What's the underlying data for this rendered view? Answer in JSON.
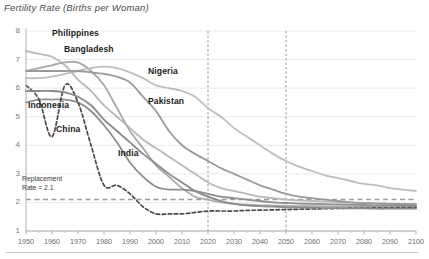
{
  "title": "Fertility Rate (Births per Woman)",
  "annotation": {
    "line1": "Replacement",
    "line2": "Rate = 2.1"
  },
  "axes": {
    "y_ticks": [
      "8",
      "7",
      "6",
      "5",
      "4",
      "3",
      "2",
      "1"
    ],
    "x_ticks": [
      "1950",
      "1960",
      "1970",
      "1980",
      "1990",
      "2000",
      "2010",
      "2020",
      "2030",
      "2040",
      "2050",
      "2060",
      "2070",
      "2080",
      "2090",
      "2100"
    ]
  },
  "series_labels": {
    "philippines": "Philippines",
    "bangladesh": "Bangladesh",
    "nigeria": "Nigeria",
    "pakistan": "Pakistan",
    "indonesia": "Indonesia",
    "china": "China",
    "india": "India"
  },
  "colors": {
    "philippines": "#b9b9b9",
    "bangladesh": "#a8a8a8",
    "nigeria": "#bdbdbd",
    "pakistan": "#9a9a9a",
    "indonesia": "#8e8e8e",
    "china": "#4a4a4a",
    "india": "#8a8a8a",
    "replacement": "#9a9a9a",
    "grid": "#e6e6e6",
    "marker_line": "#909090"
  },
  "chart_data": {
    "type": "line",
    "title": "Fertility Rate (Births per Woman)",
    "xlabel": "",
    "ylabel": "Births per Woman",
    "xlim": [
      1950,
      2100
    ],
    "ylim": [
      1,
      8
    ],
    "grid": true,
    "legend": "inline-labels",
    "replacement_rate": 2.1,
    "vertical_markers": [
      2020,
      2050
    ],
    "x": [
      1950,
      1955,
      1960,
      1965,
      1970,
      1975,
      1980,
      1985,
      1990,
      1995,
      2000,
      2005,
      2010,
      2015,
      2020,
      2025,
      2030,
      2035,
      2040,
      2045,
      2050,
      2055,
      2060,
      2065,
      2070,
      2075,
      2080,
      2085,
      2090,
      2095,
      2100
    ],
    "series": [
      {
        "name": "Philippines",
        "values": [
          7.3,
          7.2,
          7.1,
          6.8,
          6.3,
          5.9,
          5.4,
          5.0,
          4.6,
          4.2,
          3.9,
          3.6,
          3.3,
          3.0,
          2.7,
          2.5,
          2.4,
          2.3,
          2.2,
          2.15,
          2.1,
          2.07,
          2.05,
          2.03,
          2.0,
          1.99,
          1.98,
          1.97,
          1.96,
          1.95,
          1.95
        ]
      },
      {
        "name": "Bangladesh",
        "values": [
          6.6,
          6.7,
          6.8,
          6.9,
          6.9,
          6.6,
          6.1,
          5.3,
          4.5,
          3.9,
          3.3,
          2.9,
          2.5,
          2.2,
          2.1,
          2.0,
          1.95,
          1.92,
          1.9,
          1.89,
          1.88,
          1.87,
          1.87,
          1.86,
          1.86,
          1.86,
          1.85,
          1.85,
          1.85,
          1.85,
          1.85
        ]
      },
      {
        "name": "Nigeria",
        "values": [
          6.35,
          6.35,
          6.4,
          6.5,
          6.6,
          6.7,
          6.75,
          6.7,
          6.55,
          6.35,
          6.1,
          6.0,
          5.9,
          5.7,
          5.3,
          5.0,
          4.6,
          4.3,
          4.0,
          3.7,
          3.45,
          3.25,
          3.1,
          2.95,
          2.85,
          2.75,
          2.65,
          2.6,
          2.5,
          2.45,
          2.4
        ]
      },
      {
        "name": "Pakistan",
        "values": [
          6.6,
          6.6,
          6.6,
          6.6,
          6.6,
          6.55,
          6.5,
          6.4,
          6.2,
          5.7,
          5.2,
          4.5,
          4.0,
          3.7,
          3.45,
          3.2,
          3.0,
          2.8,
          2.6,
          2.45,
          2.3,
          2.2,
          2.15,
          2.1,
          2.05,
          2.0,
          1.98,
          1.96,
          1.95,
          1.94,
          1.93
        ]
      },
      {
        "name": "Indonesia",
        "values": [
          5.5,
          5.6,
          5.6,
          5.6,
          5.5,
          5.2,
          4.7,
          4.1,
          3.4,
          2.9,
          2.55,
          2.45,
          2.45,
          2.4,
          2.3,
          2.2,
          2.15,
          2.1,
          2.05,
          2.0,
          1.98,
          1.96,
          1.95,
          1.94,
          1.93,
          1.92,
          1.91,
          1.9,
          1.9,
          1.9,
          1.9
        ]
      },
      {
        "name": "China",
        "values": [
          6.1,
          5.6,
          4.3,
          6.1,
          5.5,
          4.0,
          2.6,
          2.6,
          2.3,
          1.85,
          1.6,
          1.6,
          1.6,
          1.65,
          1.7,
          1.7,
          1.7,
          1.72,
          1.73,
          1.74,
          1.75,
          1.76,
          1.77,
          1.78,
          1.79,
          1.8,
          1.8,
          1.81,
          1.81,
          1.82,
          1.82
        ]
      },
      {
        "name": "India",
        "values": [
          5.9,
          5.9,
          5.9,
          5.85,
          5.7,
          5.4,
          4.9,
          4.5,
          4.1,
          3.7,
          3.35,
          3.0,
          2.7,
          2.4,
          2.2,
          2.05,
          1.95,
          1.9,
          1.87,
          1.85,
          1.83,
          1.82,
          1.81,
          1.8,
          1.8,
          1.79,
          1.79,
          1.78,
          1.78,
          1.78,
          1.78
        ]
      }
    ]
  }
}
